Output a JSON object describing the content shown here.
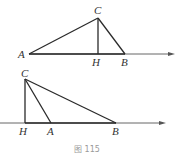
{
  "figures": [
    {
      "id": "top",
      "description": "Acute triangle ABC with altitude CH, foot H between A and B, on a ray",
      "points": {
        "A": {
          "label": "A",
          "x": 29,
          "y": 54,
          "lx": 18,
          "ly": 58
        },
        "C": {
          "label": "C",
          "x": 98,
          "y": 18,
          "lx": 94,
          "ly": 14
        },
        "H": {
          "label": "H",
          "x": 98,
          "y": 54,
          "lx": 93,
          "ly": 66
        },
        "B": {
          "label": "B",
          "x": 125,
          "y": 54,
          "lx": 121,
          "ly": 66
        }
      },
      "ray": {
        "x1": 29,
        "y1": 54,
        "x2": 174,
        "y2": 54
      }
    },
    {
      "id": "bottom",
      "description": "Obtuse triangle ABC with altitude CH, foot H outside segment AB, on a ray",
      "points": {
        "C": {
          "label": "C",
          "x": 25,
          "y": 79,
          "lx": 22,
          "ly": 76
        },
        "H": {
          "label": "H",
          "x": 25,
          "y": 123,
          "lx": 19,
          "ly": 135
        },
        "A": {
          "label": "A",
          "x": 51,
          "y": 123,
          "lx": 47,
          "ly": 135
        },
        "B": {
          "label": "B",
          "x": 116,
          "y": 123,
          "lx": 112,
          "ly": 135
        }
      },
      "ray": {
        "x1": 0,
        "y1": 123,
        "x2": 166,
        "y2": 123
      }
    }
  ],
  "labels": {
    "top": {
      "A": "A",
      "C": "C",
      "H": "H",
      "B": "B"
    },
    "bottom": {
      "C": "C",
      "H": "H",
      "A": "A",
      "B": "B"
    }
  },
  "caption": "图 115"
}
